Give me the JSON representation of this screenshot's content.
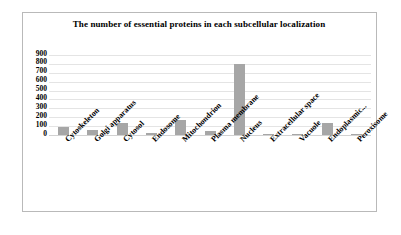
{
  "chart_data": {
    "type": "bar",
    "title": "The number of essential proteins in each subcellular localization",
    "xlabel": "",
    "ylabel": "",
    "ylim": [
      0,
      900
    ],
    "ytick_labels": [
      "900",
      "800",
      "700",
      "600",
      "500",
      "400",
      "300",
      "200",
      "100",
      "0"
    ],
    "yticks": [
      900,
      800,
      700,
      600,
      500,
      400,
      300,
      200,
      100,
      0
    ],
    "grid": true,
    "legend": "none",
    "bar_color": "#a6a6a6",
    "categories": [
      "Cytoskeleton",
      "Golgi apparatus",
      "Cytosol",
      "Endosome",
      "Mitochondrion",
      "Plasma membrane",
      "Nucleus",
      "Extracellular space",
      "Vacuole",
      "Endoplasmic...",
      "Peroxisome"
    ],
    "values": [
      95,
      60,
      130,
      20,
      165,
      45,
      800,
      2,
      15,
      130,
      3
    ]
  },
  "frame": {
    "border_color": "#b9b9b9"
  }
}
